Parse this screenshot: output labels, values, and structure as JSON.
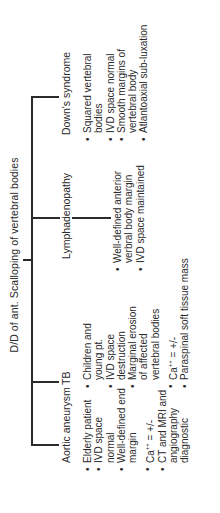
{
  "diagram": {
    "title": "D/D of ant. Scalloping of vertebral bodies",
    "orientation": "rotated 90deg counter-clockwise",
    "branches": [
      {
        "label": "Aortic aneurysm",
        "items": [
          "Elderly patient",
          "IVD space normal",
          "Well-defined end margin",
          "Ca++ = +/-",
          "CT and MRI and angiography diagnostic"
        ]
      },
      {
        "label": "TB",
        "items": [
          "Children and young pt.",
          "IVD space destruction",
          "Marginal erosion of affected vertebral bodies",
          "Ca++ = +/-",
          "Paraspinal soft tissue mass"
        ]
      },
      {
        "label": "Lymphadenopathy",
        "items": [
          "Well-defined anterior verbral body margin",
          "IVD space maintained"
        ]
      },
      {
        "label": "Down's syndrome",
        "items": [
          "Squared vertebral bodies",
          "IVD space normal",
          "Smooth margins of vertebral body",
          "Atlantoaxial sub-luxation"
        ]
      }
    ],
    "colors": {
      "line": "#2b2b2b",
      "text": "#2a2a2a",
      "background": "#ffffff"
    }
  }
}
